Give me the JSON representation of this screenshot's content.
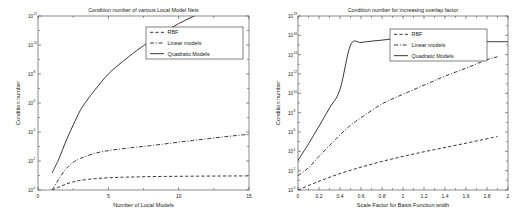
{
  "figure": {
    "background": "#ffffff",
    "ink": "#1a1a1a"
  },
  "chart_data": [
    {
      "type": "line",
      "panel": "left",
      "title": "Condition number of various Local Model Nets",
      "xlabel": "Number of Local Models",
      "ylabel": "Condition number",
      "yscale": "log",
      "xlim": [
        0,
        15
      ],
      "ylim": [
        1,
        1000000000000.0
      ],
      "xticks": [
        0,
        5,
        10,
        15
      ],
      "xticklabels": [
        "0",
        "5",
        "10",
        "15"
      ],
      "yticks": [
        1,
        100,
        10000,
        1000000,
        100000000,
        10000000000,
        1000000000000
      ],
      "yticklabels": [
        "10^0",
        "10^2",
        "10^4",
        "10^6",
        "10^8",
        "10^10",
        "10^12"
      ],
      "ytick_mantissa": [
        "10",
        "10",
        "10",
        "10",
        "10",
        "10",
        "10"
      ],
      "ytick_exponent": [
        "0",
        "2",
        "4",
        "6",
        "8",
        "10",
        "12"
      ],
      "grid": false,
      "legend_position": "upper center",
      "legend": [
        "RBF",
        "Linear models",
        "Quadratic Models"
      ],
      "series": [
        {
          "name": "RBF",
          "style": "dashed",
          "x": [
            1,
            1.5,
            2,
            2.5,
            3,
            4,
            5,
            6,
            7,
            8,
            9,
            10,
            11,
            12,
            13,
            14,
            15
          ],
          "y": [
            1.0,
            1.6,
            2.6,
            3.6,
            4.6,
            6.0,
            7.0,
            7.6,
            8.0,
            8.4,
            8.6,
            8.8,
            9.0,
            9.1,
            9.2,
            9.3,
            9.4
          ]
        },
        {
          "name": "Linear models",
          "style": "dashdot",
          "x": [
            1,
            1.5,
            2,
            2.5,
            3,
            4,
            5,
            6,
            7,
            8,
            9,
            10,
            11,
            12,
            13,
            14,
            15
          ],
          "y": [
            1.0,
            6,
            30,
            80,
            150,
            330,
            520,
            700,
            900,
            1150,
            1500,
            2000,
            2600,
            3400,
            4400,
            5600,
            7000
          ]
        },
        {
          "name": "Quadratic Models",
          "style": "solid",
          "x": [
            1,
            1.5,
            2,
            2.5,
            3,
            3.5,
            4,
            5,
            6,
            7,
            8,
            9,
            10,
            11,
            12,
            13,
            14,
            15
          ],
          "y": [
            15,
            150,
            2500,
            30000,
            300000,
            1600000,
            7000000,
            100000000,
            700000000,
            4000000000,
            20000000000,
            80000000000,
            300000000000,
            900000000000,
            2500000000000,
            6000000000000,
            13000000000000.0,
            25000000000000.0
          ]
        }
      ]
    },
    {
      "type": "line",
      "panel": "right",
      "title": "Condition number for increasing overlap factor",
      "xlabel": "Scale Factor for Basis Function width",
      "ylabel": "Condition number",
      "yscale": "log",
      "xlim": [
        0,
        2
      ],
      "ylim": [
        1,
        1e+18
      ],
      "xticks": [
        0,
        0.2,
        0.4,
        0.6,
        0.8,
        1,
        1.2,
        1.4,
        1.6,
        1.8,
        2
      ],
      "xticklabels": [
        "0",
        "0.2",
        "0.4",
        "0.6",
        "0.8",
        "1",
        "1.2",
        "1.4",
        "1.6",
        "1.8",
        "2"
      ],
      "yticks": [
        1,
        100,
        10000,
        1000000,
        100000000,
        10000000000,
        1000000000000,
        100000000000000,
        1e+16,
        1e+18
      ],
      "yticklabels": [
        "10^0",
        "10^2",
        "10^4",
        "10^6",
        "10^8",
        "10^10",
        "10^12",
        "10^14",
        "10^16",
        "10^18"
      ],
      "ytick_mantissa": [
        "10",
        "10",
        "10",
        "10",
        "10",
        "10",
        "10",
        "10",
        "10",
        "10"
      ],
      "ytick_exponent": [
        "0",
        "2",
        "4",
        "6",
        "8",
        "10",
        "12",
        "14",
        "16",
        "18"
      ],
      "grid": false,
      "legend_position": "upper right",
      "legend": [
        "RBF",
        "Linear models",
        "Quadratic Models"
      ],
      "series": [
        {
          "name": "RBF",
          "style": "dashed",
          "x": [
            0,
            0.2,
            0.4,
            0.6,
            0.8,
            1.0,
            1.2,
            1.4,
            1.6,
            1.8,
            1.9
          ],
          "y": [
            1.0,
            8,
            50,
            230,
            900,
            3000,
            9000,
            25000,
            70000,
            200000,
            350000
          ]
        },
        {
          "name": "Linear models",
          "style": "dashdot",
          "x": [
            0,
            0.1,
            0.2,
            0.3,
            0.4,
            0.5,
            0.6,
            0.8,
            1.0,
            1.2,
            1.4,
            1.6,
            1.8,
            1.9
          ],
          "y": [
            30,
            200,
            3000,
            40000,
            500000,
            5000000,
            30000000,
            800000000,
            8000000000,
            70000000000,
            600000000000,
            4000000000000,
            30000000000000.0,
            60000000000000.0
          ]
        },
        {
          "name": "Quadratic Models",
          "style": "solid",
          "x": [
            0,
            0.1,
            0.2,
            0.3,
            0.4,
            0.5,
            0.6,
            0.7,
            0.8,
            0.9,
            1.0,
            1.2,
            1.4,
            1.6,
            1.8,
            2.0
          ],
          "y": [
            1200,
            60000,
            4000000,
            300000000,
            25000000000.0,
            1000000000000000.0,
            1800000000000000.0,
            2500000000000000.0,
            3200000000000000.0,
            4000000000000000.0,
            3000000000000000.0,
            2200000000000000.0,
            2200000000000000.0,
            2200000000000000.0,
            2200000000000000.0,
            2200000000000000.0
          ]
        }
      ]
    }
  ]
}
